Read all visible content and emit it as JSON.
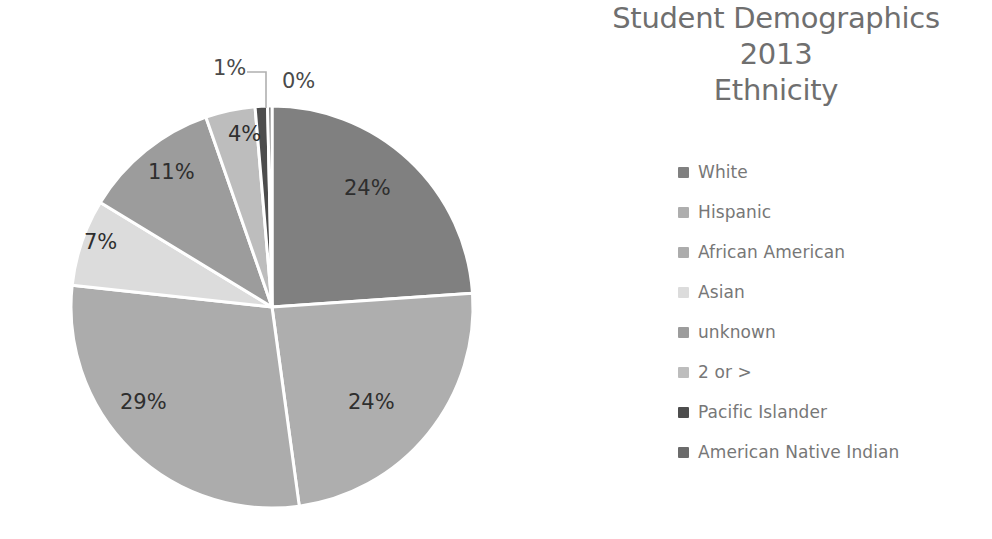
{
  "chart_data": {
    "type": "pie",
    "title": "Student Demographics 2013 Ethnicity",
    "title_lines": [
      "Student Demographics",
      "2013",
      "Ethnicity"
    ],
    "categories": [
      "White",
      "Hispanic",
      "African American",
      "Asian",
      "unknown",
      "2 or >",
      "Pacific Islander",
      "American Native Indian"
    ],
    "values": [
      24,
      24,
      29,
      7,
      11,
      4,
      1,
      0
    ],
    "value_labels": [
      "24%",
      "24%",
      "29%",
      "7%",
      "11%",
      "4%",
      "1%",
      "0%"
    ],
    "colors": [
      "#808080",
      "#aeaeae",
      "#acacac",
      "#dcdcdc",
      "#9c9c9c",
      "#bdbdbd",
      "#4d4d4d",
      "#6b6b6b"
    ],
    "legend_position": "right",
    "grid": false,
    "xlabel": "",
    "ylabel": "",
    "data_label_format": "percentage",
    "slice_start_angle_deg": 0,
    "slice_direction": "clockwise"
  },
  "title": {
    "line1": "Student Demographics",
    "line2": "2013",
    "line3": "Ethnicity"
  },
  "legend": {
    "items": [
      {
        "label": "White",
        "color": "#808080",
        "value_label": "24%"
      },
      {
        "label": "Hispanic",
        "color": "#aeaeae",
        "value_label": "24%"
      },
      {
        "label": "African American",
        "color": "#acacac",
        "value_label": "29%"
      },
      {
        "label": "Asian",
        "color": "#dcdcdc",
        "value_label": "7%"
      },
      {
        "label": "unknown",
        "color": "#9c9c9c",
        "value_label": "11%"
      },
      {
        "label": "2 or >",
        "color": "#bdbdbd",
        "value_label": "4%"
      },
      {
        "label": "Pacific Islander",
        "color": "#4d4d4d",
        "value_label": "1%"
      },
      {
        "label": "American Native Indian",
        "color": "#6b6b6b",
        "value_label": "0%"
      }
    ]
  },
  "pie_labels": {
    "white": "24%",
    "hispanic": "24%",
    "african_american": "29%",
    "asian": "7%",
    "unknown": "11%",
    "two_or_more": "4%",
    "pacific_islander": "1%",
    "american_native_indian": "0%"
  }
}
